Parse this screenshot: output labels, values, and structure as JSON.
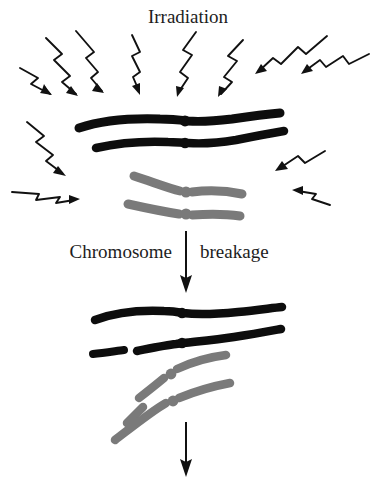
{
  "figure": {
    "title": "Irradiation",
    "background_color": "#ffffff",
    "labels": {
      "top": "Irradiation",
      "middle_left": "Chromosome",
      "middle_right": "breakage",
      "bottom_cropped": ""
    },
    "colors": {
      "ink": "#111111",
      "chromosome_black": "#0d0d0d",
      "chromosome_gray": "#7a7a7a",
      "text": "#1d1d1d"
    },
    "stages": [
      {
        "name": "stage-irradiation",
        "description": "Intact homologous chromosome pairs bombarded by radiation",
        "chromosomes": [
          {
            "id": "black-chromosome-1",
            "color": "#0d0d0d",
            "state": "intact",
            "tilt": "horizontal"
          },
          {
            "id": "black-chromosome-2",
            "color": "#0d0d0d",
            "state": "intact",
            "tilt": "horizontal"
          },
          {
            "id": "gray-chromosome-1",
            "color": "#7a7a7a",
            "state": "intact",
            "tilt": "horizontal"
          },
          {
            "id": "gray-chromosome-2",
            "color": "#7a7a7a",
            "state": "intact",
            "tilt": "horizontal"
          }
        ],
        "radiation_arrows_count": 10
      },
      {
        "name": "stage-breakage",
        "description": "Chromosomes after breakage, with fragments detached",
        "chromosomes": [
          {
            "id": "black-chromosome-3",
            "color": "#0d0d0d",
            "state": "intact",
            "tilt": "horizontal"
          },
          {
            "id": "black-chromosome-4",
            "color": "#0d0d0d",
            "state": "broken",
            "tilt": "horizontal"
          },
          {
            "id": "gray-chromosome-3",
            "color": "#7a7a7a",
            "state": "broken",
            "tilt": "diagonal"
          },
          {
            "id": "gray-chromosome-4",
            "color": "#7a7a7a",
            "state": "intact",
            "tilt": "diagonal"
          }
        ]
      }
    ],
    "flow_arrows": [
      {
        "id": "arrow-chromosome-breakage",
        "direction": "down"
      },
      {
        "id": "arrow-next-stage",
        "direction": "down"
      }
    ]
  }
}
